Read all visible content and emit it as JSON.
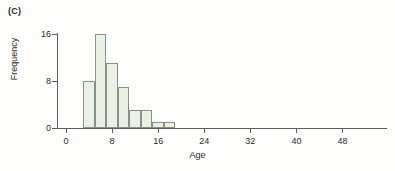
{
  "panel": {
    "label": "(C)"
  },
  "chart_data": {
    "type": "bar",
    "title": "",
    "subtitle": "",
    "xlabel": "Age",
    "ylabel": "Frequency",
    "xlim": [
      -2,
      55
    ],
    "ylim": [
      0,
      17
    ],
    "grid": false,
    "legend": null,
    "bin_width": 2,
    "categories": [
      "3-5",
      "5-7",
      "7-9",
      "9-11",
      "11-13",
      "13-15",
      "15-17",
      "17-19"
    ],
    "bin_edges": [
      3,
      5,
      7,
      9,
      11,
      13,
      15,
      17,
      19
    ],
    "values": [
      8,
      16,
      11,
      7,
      3,
      3,
      1,
      1
    ],
    "xticks": [
      0,
      8,
      16,
      24,
      32,
      40,
      48
    ],
    "xtick_labels": [
      "0",
      "8",
      "16",
      "24",
      "32",
      "40",
      "48"
    ],
    "yticks": [
      0,
      8,
      16
    ],
    "ytick_labels": [
      "0",
      "8",
      "16"
    ],
    "bar_fill_color": "#eaf0e3",
    "bar_edge_color": "#8a8f88",
    "axis_color": "#5d5d5d"
  }
}
